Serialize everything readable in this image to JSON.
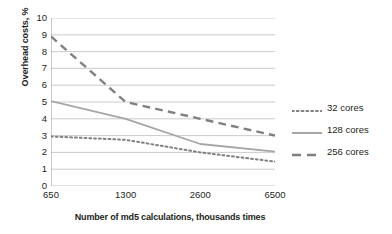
{
  "chart_data": {
    "type": "line",
    "title": "",
    "xlabel": "Number of md5 calculations, thousands times",
    "ylabel": "Overhead costs, %",
    "categories": [
      "650",
      "1300",
      "2600",
      "6500"
    ],
    "ylim": [
      0,
      10
    ],
    "yticks": [
      "0",
      "1",
      "2",
      "3",
      "4",
      "5",
      "6",
      "7",
      "8",
      "9",
      "10"
    ],
    "grid": "horizontal",
    "legend_position": "right",
    "series": [
      {
        "name": "32 cores",
        "style": "dotted",
        "color": "#808080",
        "values": [
          2.95,
          2.75,
          2.0,
          1.45
        ]
      },
      {
        "name": "128 cores",
        "style": "solid",
        "color": "#a6a6a6",
        "values": [
          5.05,
          4.0,
          2.5,
          2.05
        ]
      },
      {
        "name": "256 cores",
        "style": "dashed",
        "color": "#808080",
        "values": [
          8.9,
          5.0,
          4.0,
          3.0
        ]
      }
    ]
  },
  "axes": {
    "y_title": "Overhead costs, %",
    "x_title": "Number of md5 calculations, thousands times"
  },
  "legend": {
    "items": [
      {
        "label": "32 cores"
      },
      {
        "label": "128 cores"
      },
      {
        "label": "256 cores"
      }
    ]
  },
  "colors": {
    "grid": "#bfbfbf",
    "axis": "#9a9a9a",
    "text": "#231f20",
    "series_gray": "#808080",
    "series_light": "#a6a6a6",
    "background": "#ffffff"
  }
}
